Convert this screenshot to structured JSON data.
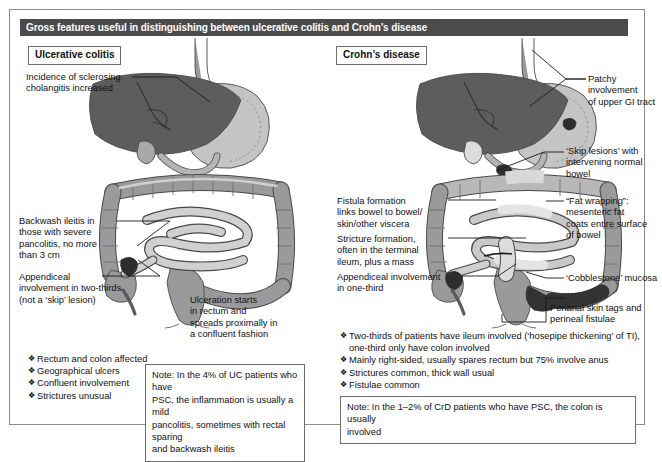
{
  "figure": {
    "title": "Gross features useful in distinguishing between ulcerative colitis and Crohn’s disease"
  },
  "panels": {
    "left": {
      "tag": "Ulcerative colitis",
      "callouts": [
        {
          "name": "sclerosing-cholangitis",
          "text": "Incidence of sclerosing\ncholangitis increased"
        },
        {
          "name": "backwash-ileitis",
          "text": "Backwash ileitis in\nthose with severe\npancolitis, no more\nthan 3 cm"
        },
        {
          "name": "appendiceal-involvement",
          "text": "Appendiceal\ninvolvement in two-thirds\n(not a ‘skip’ lesion)"
        },
        {
          "name": "ulceration-rectum",
          "text": "Ulceration starts\nin rectum and\nspreads proximally in\na confluent fashion"
        }
      ],
      "bullets": [
        "Rectum and colon affected",
        "Geographical ulcers",
        "Confluent involvement",
        "Strictures unusual"
      ],
      "note": "Note: In the 4% of UC patients who have\nPSC, the inflammation is usually a mild\npancolitis, sometimes with rectal sparing\nand backwash ileitis"
    },
    "right": {
      "tag": "Crohn’s disease",
      "callouts": [
        {
          "name": "patchy-upper-gi",
          "text": "Patchy involvement\nof upper GI tract"
        },
        {
          "name": "skip-lesions",
          "text": "‘Skip lesions’ with\nintervening normal\nbowel"
        },
        {
          "name": "fat-wrapping",
          "text": "“Fat wrapping”:\nmesenteric fat\ncoats entire surface\nof bowel"
        },
        {
          "name": "cobblestone-mucosa",
          "text": "‘Cobblestone’ mucosa"
        },
        {
          "name": "perianal-skin-tags",
          "text": "Perianal skin tags and\nperineal fistulae"
        },
        {
          "name": "fistula-formation",
          "text": "Fistula formation\nlinks bowel to bowel/\nskin/other viscera"
        },
        {
          "name": "stricture-formation",
          "text": "Stricture formation,\noften in the terminal\nileum, plus a mass"
        },
        {
          "name": "appendiceal-involvement",
          "text": "Appendiceal involvement\nin one-third"
        }
      ],
      "bullets": [
        "Two-thirds of patients have ileum involved (‘hosepipe thickening’ of TI),\none-third only have colon involved",
        "Mainly right-sided, usually spares rectum but 75% involve anus",
        "Strictures common, thick wall usual",
        "Fistulae common"
      ],
      "note": "Note: In the 1–2% of CrD patients who have PSC, the colon is usually\ninvolved"
    }
  },
  "colors": {
    "title_bar_bg": "#4b4b4b",
    "title_bar_text": "#ffffff",
    "liver_dark": "#5d5d5d",
    "organ_mid": "#9a9a9a",
    "organ_light": "#c4c4c4",
    "organ_pale": "#d8d8d8",
    "lesion_dark": "#3a3a3a",
    "outline": "#4a4a4a",
    "border": "#6d6d6d",
    "page_bg": "#ffffff"
  }
}
